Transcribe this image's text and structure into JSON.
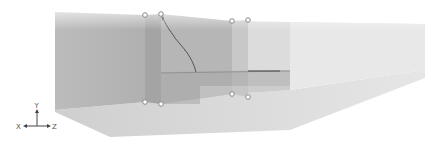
{
  "viewport": {
    "background": "#ffffff",
    "scene": {
      "left_block_color": "#b4b4b4",
      "right_block_color": "#e4e4e4",
      "floor_color": "#d6d6d6",
      "section_plane_color": "#a2a2a2",
      "shelf_line_color": "#6e6e6e",
      "curve_color": "#4a4a4a"
    },
    "handles": [
      {
        "name": "handle-top-left-a",
        "x": 145,
        "y": 15
      },
      {
        "name": "handle-top-left-b",
        "x": 161,
        "y": 14
      },
      {
        "name": "handle-top-right-a",
        "x": 232,
        "y": 21
      },
      {
        "name": "handle-top-right-b",
        "x": 248,
        "y": 20
      },
      {
        "name": "handle-bottom-left-a",
        "x": 145,
        "y": 102
      },
      {
        "name": "handle-bottom-left-b",
        "x": 161,
        "y": 104
      },
      {
        "name": "handle-bottom-right-a",
        "x": 232,
        "y": 94
      },
      {
        "name": "handle-bottom-right-b",
        "x": 248,
        "y": 97
      }
    ],
    "axis_triad": {
      "y_label": "Y",
      "x_label": "X",
      "z_label": "Z"
    }
  }
}
